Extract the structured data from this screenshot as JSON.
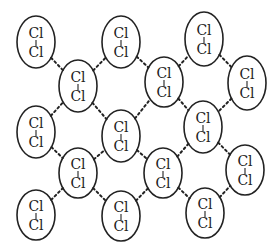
{
  "diagram": {
    "atom_top": "Cl",
    "atom_bottom": "Cl",
    "colors": {
      "stroke": "#222222",
      "background": "#ffffff"
    },
    "molecules": [
      {
        "id": "m1",
        "cx": 36,
        "cy": 42,
        "rx": 19,
        "ry": 26
      },
      {
        "id": "m2",
        "cx": 121,
        "cy": 42,
        "rx": 19,
        "ry": 26
      },
      {
        "id": "m3",
        "cx": 204,
        "cy": 39,
        "rx": 19,
        "ry": 27
      },
      {
        "id": "m4",
        "cx": 78,
        "cy": 86,
        "rx": 19,
        "ry": 26
      },
      {
        "id": "m5",
        "cx": 164,
        "cy": 82,
        "rx": 19,
        "ry": 25
      },
      {
        "id": "m6",
        "cx": 247,
        "cy": 83,
        "rx": 19,
        "ry": 27
      },
      {
        "id": "m7",
        "cx": 36,
        "cy": 132,
        "rx": 19,
        "ry": 26
      },
      {
        "id": "m8",
        "cx": 121,
        "cy": 136,
        "rx": 19,
        "ry": 26
      },
      {
        "id": "m9",
        "cx": 203,
        "cy": 127,
        "rx": 19,
        "ry": 26
      },
      {
        "id": "m10",
        "cx": 78,
        "cy": 173,
        "rx": 19,
        "ry": 25
      },
      {
        "id": "m11",
        "cx": 163,
        "cy": 173,
        "rx": 19,
        "ry": 25
      },
      {
        "id": "m12",
        "cx": 245,
        "cy": 170,
        "rx": 19,
        "ry": 25
      },
      {
        "id": "m13",
        "cx": 36,
        "cy": 215,
        "rx": 19,
        "ry": 25
      },
      {
        "id": "m14",
        "cx": 121,
        "cy": 216,
        "rx": 19,
        "ry": 25
      },
      {
        "id": "m15",
        "cx": 205,
        "cy": 213,
        "rx": 19,
        "ry": 25
      }
    ],
    "links": [
      [
        "m1",
        "m4"
      ],
      [
        "m4",
        "m2"
      ],
      [
        "m2",
        "m5"
      ],
      [
        "m5",
        "m3"
      ],
      [
        "m3",
        "m6"
      ],
      [
        "m7",
        "m4"
      ],
      [
        "m4",
        "m8"
      ],
      [
        "m8",
        "m5"
      ],
      [
        "m5",
        "m9"
      ],
      [
        "m6",
        "m9"
      ],
      [
        "m7",
        "m10"
      ],
      [
        "m10",
        "m8"
      ],
      [
        "m8",
        "m11"
      ],
      [
        "m11",
        "m9"
      ],
      [
        "m9",
        "m12"
      ],
      [
        "m13",
        "m10"
      ],
      [
        "m10",
        "m14"
      ],
      [
        "m14",
        "m11"
      ],
      [
        "m11",
        "m15"
      ],
      [
        "m15",
        "m12"
      ]
    ]
  }
}
